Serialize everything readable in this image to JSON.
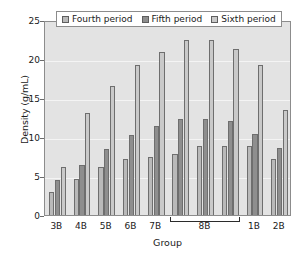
{
  "chart_data": {
    "type": "bar",
    "title": "",
    "xlabel": "Group",
    "ylabel": "Density (g/mL)",
    "ylim": [
      0,
      25
    ],
    "yticks": [
      0,
      5,
      10,
      15,
      20,
      25
    ],
    "grid": true,
    "legend_position": "top-center",
    "categories": [
      "3B",
      "4B",
      "5B",
      "6B",
      "7B",
      "8B",
      "8B",
      "8B",
      "1B",
      "2B"
    ],
    "tick_labels": [
      "3B",
      "4B",
      "5B",
      "6B",
      "7B",
      "8B",
      "1B",
      "2B"
    ],
    "bracket": {
      "label": "8B",
      "spans_categories": [
        5,
        6,
        7
      ]
    },
    "series": [
      {
        "name": "Fourth period",
        "color": "#b9b9b9",
        "values": [
          3.0,
          4.6,
          6.1,
          7.2,
          7.4,
          7.8,
          8.9,
          8.9,
          8.9,
          7.2
        ]
      },
      {
        "name": "Fifth period",
        "color": "#8e8e8e",
        "values": [
          4.5,
          6.4,
          8.5,
          10.3,
          11.4,
          12.3,
          12.3,
          12.0,
          10.4,
          8.6
        ]
      },
      {
        "name": "Sixth period",
        "color": "#c9c9c9",
        "values": [
          6.1,
          13.1,
          16.5,
          19.2,
          20.9,
          22.4,
          22.4,
          21.3,
          19.2,
          13.4
        ]
      }
    ]
  },
  "colors": {
    "plot_background": "#e3e3e3",
    "page_background": "#ffffff",
    "axis": "#8c8c8c",
    "gridline": "#f4f4f4",
    "text": "#1a1a1a",
    "bar_outline": "#6e6e6e"
  }
}
